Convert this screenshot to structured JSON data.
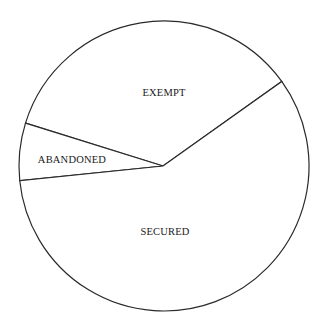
{
  "chart_data": {
    "type": "pie",
    "title": "",
    "categories": [
      "EXEMPT",
      "ABANDONED",
      "SECURED"
    ],
    "values": [
      35.3,
      6.4,
      58.3
    ],
    "unit": "percent (estimated from slice angles)",
    "start_angle_deg": 35.7,
    "direction": "counterclockwise",
    "legend": "none (labels inside slices)",
    "colors": {
      "fill": "#ffffff",
      "stroke": "#2a2a2a",
      "text": "#1a1a1a"
    }
  },
  "labels": {
    "exempt": "EXEMPT",
    "abandoned": "ABANDONED",
    "secured": "SECURED"
  }
}
